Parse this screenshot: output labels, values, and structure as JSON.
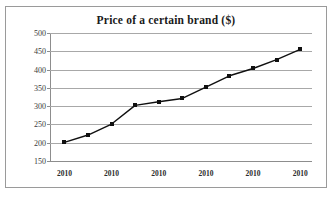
{
  "chart_data": {
    "type": "line",
    "title": "Price of a certain brand ($)",
    "xlabel": "",
    "ylabel": "",
    "ylim": [
      150,
      500
    ],
    "yticks": [
      150,
      200,
      250,
      300,
      350,
      400,
      450,
      500
    ],
    "grid": true,
    "legend": "none",
    "marker": "square",
    "line_color": "#101010",
    "marker_color": "#101010",
    "grid_color": "#a8a8a8",
    "x_tick_labels": [
      "2010",
      "2010",
      "2010",
      "2010",
      "2010",
      "2010"
    ],
    "x_tick_positions": [
      0.055,
      0.235,
      0.415,
      0.595,
      0.775,
      0.955
    ],
    "x": [
      1,
      2,
      3,
      4,
      5,
      6,
      7,
      8,
      9,
      10,
      11
    ],
    "values": [
      201,
      221,
      251,
      302,
      312,
      321,
      352,
      383,
      403,
      427,
      455
    ],
    "series": [
      {
        "name": "Price",
        "values": [
          201,
          221,
          251,
          302,
          312,
          321,
          352,
          383,
          403,
          427,
          455
        ]
      }
    ],
    "point_positions": [
      {
        "xf": 0.055,
        "v": 201
      },
      {
        "xf": 0.145,
        "v": 221
      },
      {
        "xf": 0.235,
        "v": 251
      },
      {
        "xf": 0.325,
        "v": 302
      },
      {
        "xf": 0.415,
        "v": 312
      },
      {
        "xf": 0.505,
        "v": 321
      },
      {
        "xf": 0.595,
        "v": 352
      },
      {
        "xf": 0.685,
        "v": 383
      },
      {
        "xf": 0.775,
        "v": 403
      },
      {
        "xf": 0.865,
        "v": 427
      },
      {
        "xf": 0.955,
        "v": 455
      }
    ]
  }
}
